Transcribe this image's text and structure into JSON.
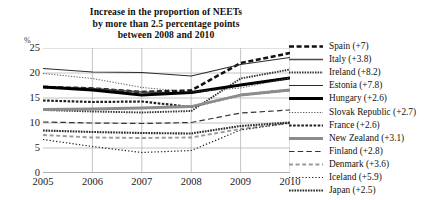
{
  "chart_data": {
    "type": "line",
    "title": "Increase in the proportion of NEETs by more than 2.5 percentage points between 2008 and 2010",
    "title_lines": [
      "Increase in the proportion of NEETs",
      "by more than 2.5 percentage points",
      "between 2008 and 2010"
    ],
    "xlabel": "",
    "ylabel": "%",
    "y_unit": "%",
    "x": [
      "2005",
      "2006",
      "2007",
      "2008",
      "2009",
      "2010"
    ],
    "categories": [
      "2005",
      "2006",
      "2007",
      "2008",
      "2009",
      "2010"
    ],
    "ylim": [
      0,
      25
    ],
    "yticks": [
      0,
      5,
      10,
      15,
      20,
      25
    ],
    "ytick_labels": [
      "0",
      "5",
      "10",
      "15",
      "20",
      "25"
    ],
    "grid": true,
    "legend_position": "right",
    "series": [
      {
        "name": "Spain (+7)",
        "country": "Spain",
        "delta": "+7",
        "style": "thick-dashed",
        "color": "#111111",
        "values": [
          17.2,
          16.9,
          16.2,
          16.5,
          22.0,
          24.0
        ]
      },
      {
        "name": "Italy (+3.8)",
        "country": "Italy",
        "delta": "+3.8",
        "style": "medium-solid",
        "color": "#4a4a4a",
        "values": [
          17.2,
          16.9,
          16.2,
          16.0,
          17.6,
          19.1
        ]
      },
      {
        "name": "Ireland (+8.2)",
        "country": "Ireland",
        "delta": "+8.2",
        "style": "dotted-dense",
        "color": "#333333",
        "values": [
          12.6,
          12.3,
          12.1,
          12.4,
          18.9,
          20.7
        ]
      },
      {
        "name": "Estonia (+7.8)",
        "country": "Estonia",
        "delta": "+7.8",
        "style": "thin-solid",
        "color": "#2b2b2b",
        "values": [
          20.9,
          20.2,
          20.1,
          19.4,
          21.7,
          23.1
        ]
      },
      {
        "name": "Hungary (+2.6)",
        "country": "Hungary",
        "delta": "+2.6",
        "style": "extra-thick-solid",
        "color": "#000000",
        "values": [
          17.2,
          16.6,
          15.6,
          16.1,
          17.6,
          19.0
        ]
      },
      {
        "name": "Slovak Republic (+2.7)",
        "country": "Slovak Republic",
        "delta": "+2.7",
        "style": "fine-dotted",
        "color": "#4d4d4d",
        "values": [
          19.9,
          18.9,
          17.1,
          16.2,
          17.0,
          19.0
        ]
      },
      {
        "name": "France (+2.6)",
        "country": "France",
        "delta": "+2.6",
        "style": "dashed-dotted-thick",
        "color": "#1f1f1f",
        "values": [
          14.5,
          14.2,
          14.3,
          13.2,
          15.6,
          16.6
        ]
      },
      {
        "name": "New Zealand (+3.1)",
        "country": "New Zealand",
        "delta": "+3.1",
        "style": "thick-grey-solid",
        "color": "#8c8c8c",
        "values": [
          12.7,
          12.8,
          13.0,
          13.3,
          15.6,
          16.6
        ]
      },
      {
        "name": "Finland (+2.8)",
        "country": "Finland",
        "delta": "+2.8",
        "style": "long-dashed",
        "color": "#333333",
        "values": [
          10.2,
          10.0,
          9.9,
          10.1,
          12.0,
          12.6
        ]
      },
      {
        "name": "Denmark (+3.6)",
        "country": "Denmark",
        "delta": "+3.6",
        "style": "grey-dashed",
        "color": "#9a9a9a",
        "values": [
          7.6,
          7.1,
          7.0,
          7.1,
          8.8,
          10.0
        ]
      },
      {
        "name": "Iceland (+5.9)",
        "country": "Iceland",
        "delta": "+5.9",
        "style": "sparse-dotted",
        "color": "#222222",
        "values": [
          6.7,
          5.3,
          4.1,
          4.5,
          8.6,
          10.0
        ]
      },
      {
        "name": "Japan (+2.5)",
        "country": "Japan",
        "delta": "+2.5",
        "style": "dotted-dense-thick",
        "color": "#2e2e2e",
        "values": [
          8.5,
          8.2,
          8.0,
          7.9,
          9.4,
          10.1
        ]
      }
    ]
  },
  "legend": {
    "items": [
      {
        "label": "Spain (+7)"
      },
      {
        "label": "Italy (+3.8)"
      },
      {
        "label": "Ireland (+8.2)"
      },
      {
        "label": "Estonia (+7.8)"
      },
      {
        "label": "Hungary (+2.6)"
      },
      {
        "label": "Slovak Republic (+2.7)"
      },
      {
        "label": "France (+2.6)"
      },
      {
        "label": "New Zealand (+3.1)"
      },
      {
        "label": "Finland (+2.8)"
      },
      {
        "label": "Denmark (+3.6)"
      },
      {
        "label": "Iceland (+5.9)"
      },
      {
        "label": "Japan (+2.5)"
      }
    ]
  },
  "colors": {
    "background": "#ffffff",
    "grid": "#b5b5b5",
    "axis": "#808080",
    "text": "#111111"
  }
}
